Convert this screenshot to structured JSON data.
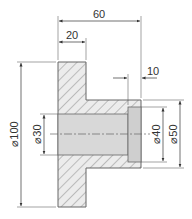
{
  "drawing": {
    "type": "sectional technical drawing of flanged bushing",
    "colors": {
      "hatch": "#8a8a8a",
      "bore_fill": "#d8d8d8",
      "line": "#555555",
      "text": "#333333"
    },
    "dimensions": {
      "overall_length": "60",
      "flange_thickness": "20",
      "counterbore_depth": "10",
      "flange_diameter": "⌀100",
      "bore_diameter": "⌀30",
      "counterbore_diameter": "⌀40",
      "hub_diameter": "⌀50"
    }
  }
}
